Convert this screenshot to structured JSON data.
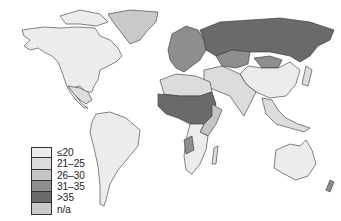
{
  "map": {
    "type": "choropleth world map",
    "legend": {
      "items": [
        {
          "label": "≤20",
          "color": "#ececec"
        },
        {
          "label": "21–25",
          "color": "#dcdcdc"
        },
        {
          "label": "26–30",
          "color": "#c4c4c4"
        },
        {
          "label": "31–35",
          "color": "#8e8e8e"
        },
        {
          "label": ">35",
          "color": "#6a6a6a"
        },
        {
          "label": "n/a",
          "color": "#c9c9c9"
        }
      ]
    },
    "regions": {
      "north_america": "≤20",
      "greenland": "n/a",
      "south_america": "≤20",
      "russia": ">35",
      "kazakhstan": "31–35",
      "mongolia": "31–35",
      "china": "≤20",
      "west_central_africa": ">35",
      "southern_africa": "≤20",
      "australia": "≤20"
    }
  }
}
